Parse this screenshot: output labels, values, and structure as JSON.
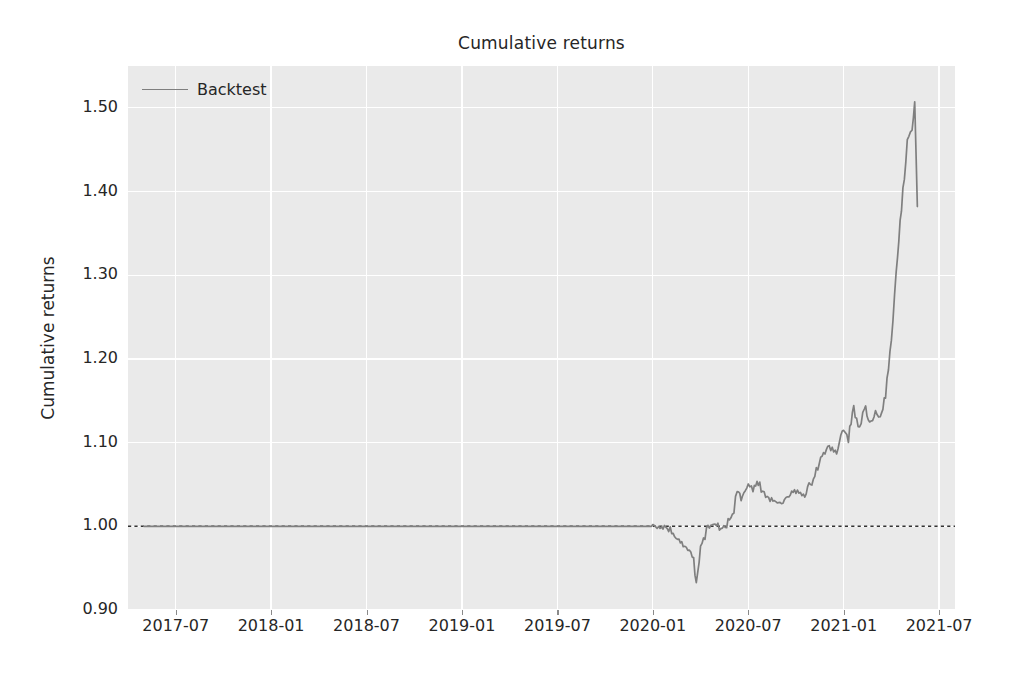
{
  "chart_data": {
    "type": "line",
    "title": "Cumulative returns",
    "xlabel": "",
    "ylabel": "Cumulative returns",
    "grid": true,
    "legend_position": "upper left",
    "xtick_labels": [
      "2017-07",
      "2018-01",
      "2018-07",
      "2019-01",
      "2019-07",
      "2020-01",
      "2020-07",
      "2021-01",
      "2021-07"
    ],
    "ytick_labels": [
      "1.50",
      "1.40",
      "1.30",
      "1.20",
      "1.10",
      "1.00",
      "0.90"
    ],
    "ylim": [
      0.9,
      1.55
    ],
    "yticks": [
      1.5,
      1.4,
      1.3,
      1.2,
      1.1,
      1.0,
      0.9
    ],
    "xlim": [
      "2017-04",
      "2021-08"
    ],
    "reference_line": {
      "value": 1.0,
      "style": "dotted",
      "color": "#333333"
    },
    "series": [
      {
        "name": "Backtest",
        "color": "#7f7f7f",
        "x": [
          "2017-05",
          "2017-07",
          "2018-01",
          "2018-07",
          "2019-01",
          "2019-07",
          "2020-01",
          "2020-02",
          "2020-02-15",
          "2020-03",
          "2020-03-10",
          "2020-03-18",
          "2020-03-23",
          "2020-04",
          "2020-04-15",
          "2020-05",
          "2020-05-15",
          "2020-06",
          "2020-06-10",
          "2020-06-20",
          "2020-07",
          "2020-07-10",
          "2020-07-20",
          "2020-08",
          "2020-08-15",
          "2020-09",
          "2020-09-15",
          "2020-10",
          "2020-10-15",
          "2020-11",
          "2020-11-15",
          "2020-12",
          "2020-12-15",
          "2021-01",
          "2021-01-10",
          "2021-01-20",
          "2021-02",
          "2021-02-10",
          "2021-02-20",
          "2021-03",
          "2021-03-10",
          "2021-03-20",
          "2021-04",
          "2021-04-10",
          "2021-04-20",
          "2021-05",
          "2021-05-10",
          "2021-05-15",
          "2021-05-20"
        ],
        "values": [
          1.0,
          1.0,
          1.0,
          1.0,
          1.0,
          1.0,
          1.0,
          0.998,
          0.985,
          0.978,
          0.972,
          0.96,
          0.928,
          0.975,
          1.0,
          1.002,
          0.995,
          1.012,
          1.04,
          1.03,
          1.055,
          1.045,
          1.052,
          1.038,
          1.032,
          1.028,
          1.035,
          1.042,
          1.038,
          1.055,
          1.075,
          1.098,
          1.085,
          1.12,
          1.105,
          1.14,
          1.118,
          1.145,
          1.125,
          1.138,
          1.132,
          1.155,
          1.22,
          1.3,
          1.38,
          1.46,
          1.47,
          1.51,
          1.382
        ]
      }
    ]
  },
  "legend": {
    "entries": [
      {
        "label": "Backtest",
        "color": "#7f7f7f"
      }
    ]
  },
  "style": {
    "plot_background": "#eaeaea",
    "figure_background": "#ffffff",
    "gridline_color": "#ffffff",
    "text_color": "#262626",
    "line_color": "#7f7f7f",
    "reference_line_color": "#333333"
  }
}
